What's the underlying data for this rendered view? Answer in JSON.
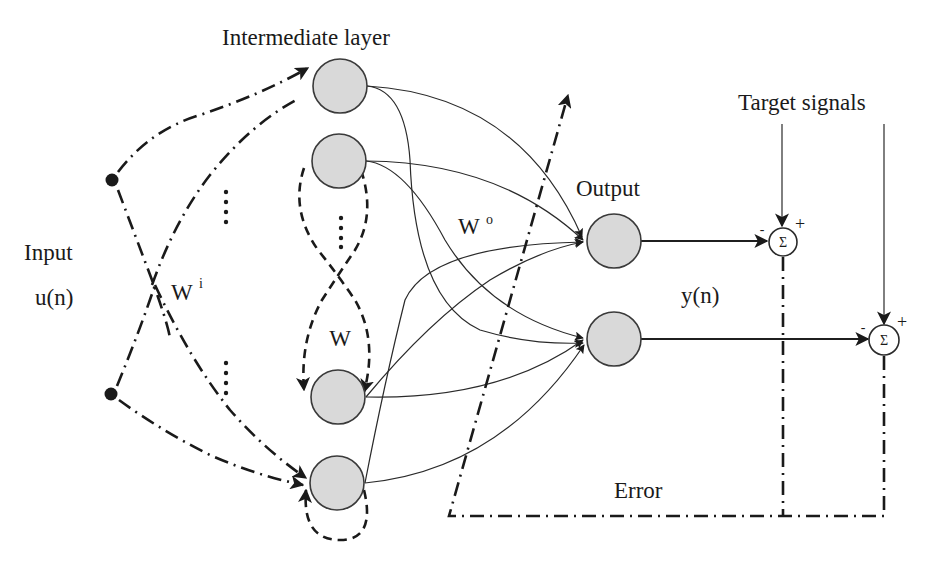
{
  "diagram": {
    "type": "echo-state-network",
    "labels": {
      "intermediate_layer": "Intermediate layer",
      "input": "Input",
      "input_signal": "u(n)",
      "input_weight": "W",
      "input_weight_sup": "i",
      "reservoir_weight": "W",
      "output_weight": "W",
      "output_weight_sup": "o",
      "output": "Output",
      "output_signal": "y(n)",
      "target_signals": "Target signals",
      "error": "Error",
      "sum_symbol": "Σ",
      "minus": "-",
      "plus": "+"
    },
    "nodes": {
      "inputs": [
        {
          "id": "input-1",
          "x": 112,
          "y": 180
        },
        {
          "id": "input-2",
          "x": 111,
          "y": 394
        }
      ],
      "reservoir": [
        {
          "id": "reservoir-1",
          "x": 340,
          "y": 86
        },
        {
          "id": "reservoir-2",
          "x": 339,
          "y": 161
        },
        {
          "id": "reservoir-3",
          "x": 338,
          "y": 397
        },
        {
          "id": "reservoir-4",
          "x": 337,
          "y": 483
        }
      ],
      "outputs": [
        {
          "id": "output-1",
          "x": 614,
          "y": 241
        },
        {
          "id": "output-2",
          "x": 614,
          "y": 339
        }
      ],
      "summers": [
        {
          "id": "sum-1",
          "x": 783,
          "y": 242
        },
        {
          "id": "sum-2",
          "x": 884,
          "y": 340
        }
      ]
    },
    "colors": {
      "neuron_fill": "#d9d9d9",
      "stroke": "#1a1a1a",
      "background": "#ffffff"
    }
  }
}
